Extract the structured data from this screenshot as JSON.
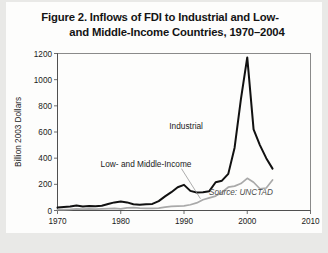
{
  "figure": {
    "title_line_1": "Figure 2. Inflows of FDI to Industrial and Low-",
    "title_line_2": "and Middle-Income Countries, 1970–2004",
    "source_note": "Source: UNCTAD"
  },
  "colors": {
    "page_background": "#e9e9e7",
    "card_background": "#fdfdfc",
    "industrial": "#111111",
    "low_and_middle_income": "#a9a9a9",
    "axis": "#4a4a4a",
    "text": "#1a1a1a"
  },
  "chart_data": {
    "type": "line",
    "title": "Figure 2. Inflows of FDI to Industrial and Low- and Middle-Income Countries, 1970–2004",
    "xlabel": "",
    "ylabel": "Billion 2003 Dollars",
    "xlim": [
      1970,
      2010
    ],
    "ylim": [
      0,
      1200
    ],
    "xticks": [
      1970,
      1980,
      1990,
      2000,
      2010
    ],
    "xtick_labels": [
      "1970",
      "1980",
      "1990",
      "2000",
      "2010"
    ],
    "yticks": [
      0,
      200,
      400,
      600,
      800,
      1000,
      1200
    ],
    "ytick_labels": [
      "0",
      "200",
      "400",
      "600",
      "800",
      "1000",
      "1200"
    ],
    "grid": false,
    "legend": "inline-annotations",
    "x": [
      1970,
      1971,
      1972,
      1973,
      1974,
      1975,
      1976,
      1977,
      1978,
      1979,
      1980,
      1981,
      1982,
      1983,
      1984,
      1985,
      1986,
      1987,
      1988,
      1989,
      1990,
      1991,
      1992,
      1993,
      1994,
      1995,
      1996,
      1997,
      1998,
      1999,
      2000,
      2001,
      2002,
      2003,
      2004
    ],
    "series": [
      {
        "name": "Industrial",
        "color": "#111111",
        "label_x": 1993,
        "label_y": 620,
        "values": [
          22,
          26,
          30,
          38,
          30,
          34,
          32,
          36,
          50,
          62,
          68,
          62,
          48,
          44,
          48,
          50,
          72,
          108,
          140,
          178,
          196,
          150,
          138,
          140,
          148,
          216,
          228,
          280,
          480,
          852,
          1170,
          620,
          500,
          400,
          320
        ]
      },
      {
        "name": "Low- and Middle-Income",
        "color": "#a9a9a9",
        "label_x": 1984,
        "label_y": 330,
        "values": [
          6,
          7,
          8,
          12,
          10,
          12,
          10,
          12,
          14,
          16,
          12,
          20,
          22,
          18,
          16,
          16,
          18,
          26,
          32,
          34,
          36,
          44,
          58,
          82,
          96,
          110,
          140,
          178,
          186,
          206,
          246,
          216,
          166,
          172,
          233
        ]
      }
    ],
    "annotations": [
      {
        "text": "Industrial",
        "x": 1993,
        "y": 620
      },
      {
        "text": "Low- and Middle-Income",
        "x": 1984,
        "y": 330
      },
      {
        "text": "Source: UNCTAD",
        "x": 1999,
        "y": 120
      }
    ]
  }
}
